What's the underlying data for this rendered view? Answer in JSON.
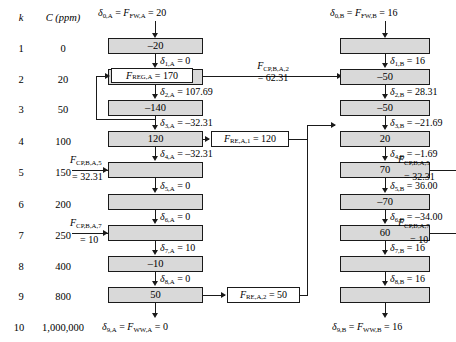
{
  "diagram": {
    "table": {
      "headers": {
        "k": "k",
        "c": "C (ppm)"
      },
      "rows": [
        {
          "k": "1",
          "c": "0"
        },
        {
          "k": "2",
          "c": "20"
        },
        {
          "k": "3",
          "c": "50"
        },
        {
          "k": "4",
          "c": "100"
        },
        {
          "k": "5",
          "c": "150"
        },
        {
          "k": "6",
          "c": "200"
        },
        {
          "k": "7",
          "c": "250"
        },
        {
          "k": "8",
          "c": "400"
        },
        {
          "k": "9",
          "c": "800"
        },
        {
          "k": "10",
          "c": "1,000,000"
        }
      ]
    },
    "columnA": {
      "inlet": "δ0,A = FFW,A = 20",
      "inlet_parts": {
        "delta": "δ",
        "sub1": "0,A",
        "eq1": "=",
        "f": "F",
        "sub2": "FW,A",
        "eq2": "=",
        "value": "20"
      },
      "boxes": [
        {
          "stage": "1",
          "value": "–20"
        },
        {
          "stage": "2",
          "value": ""
        },
        {
          "stage": "3",
          "value": "–140"
        },
        {
          "stage": "4",
          "value": "120"
        },
        {
          "stage": "5",
          "value": ""
        },
        {
          "stage": "6",
          "value": ""
        },
        {
          "stage": "7",
          "value": ""
        },
        {
          "stage": "8",
          "value": "–10"
        },
        {
          "stage": "9",
          "value": "50"
        }
      ],
      "deltas": [
        {
          "name": "δ1,A",
          "sub": "1,A",
          "value": "0"
        },
        {
          "name": "δ2,A",
          "sub": "2,A",
          "value": "107.69"
        },
        {
          "name": "δ3,A",
          "sub": "3,A",
          "value": "–32.31"
        },
        {
          "name": "δ4,A",
          "sub": "4,A",
          "value": "–32.31"
        },
        {
          "name": "δ5,A",
          "sub": "5,A",
          "value": "0"
        },
        {
          "name": "δ6,A",
          "sub": "6,A",
          "value": "0"
        },
        {
          "name": "δ7,A",
          "sub": "7,A",
          "value": "10"
        },
        {
          "name": "δ8,A",
          "sub": "8,A",
          "value": "0"
        }
      ],
      "outlet": {
        "sub1": "9,A",
        "sub2": "WW,A",
        "value": "0"
      }
    },
    "columnB": {
      "inlet_parts": {
        "sub1": "0,B",
        "sub2": "FW,B",
        "value": "16"
      },
      "boxes": [
        {
          "stage": "1",
          "value": ""
        },
        {
          "stage": "2",
          "value": "–50"
        },
        {
          "stage": "3",
          "value": "–50"
        },
        {
          "stage": "4",
          "value": "20"
        },
        {
          "stage": "5",
          "value": "70"
        },
        {
          "stage": "6",
          "value": "–70"
        },
        {
          "stage": "7",
          "value": "60"
        },
        {
          "stage": "8",
          "value": ""
        },
        {
          "stage": "9",
          "value": ""
        }
      ],
      "deltas": [
        {
          "sub": "1,B",
          "value": "16"
        },
        {
          "sub": "2,B",
          "value": "28.31"
        },
        {
          "sub": "3,B",
          "value": "–21.69"
        },
        {
          "sub": "4,B",
          "value": "–1.69"
        },
        {
          "sub": "5,B",
          "value": "36.00"
        },
        {
          "sub": "6,B",
          "value": "–34.00"
        },
        {
          "sub": "7,B",
          "value": "16"
        },
        {
          "sub": "8,B",
          "value": "16"
        }
      ],
      "outlet": {
        "sub1": "9,B",
        "sub2": "WW,B",
        "value": "16"
      }
    },
    "flow_labels": {
      "reg_a": {
        "sub": "REG,A",
        "value": "170"
      },
      "cp_ba2": {
        "sub": "CP,B,A,2",
        "value": "62.31"
      },
      "re_a1": {
        "sub": "RE,A,1",
        "value": "120"
      },
      "cp_ba5_left": {
        "sub": "CP,B,A,5",
        "value": "32.31"
      },
      "cp_ba5_right": {
        "sub": "CP,B,A,5",
        "value": "32.31"
      },
      "cp_ba7_left": {
        "sub": "CP,B,A,7",
        "value": "10"
      },
      "cp_ba7_right": {
        "sub": "CP,B,A,7",
        "value": "10"
      },
      "re_a2": {
        "sub": "RE,A,2",
        "value": "50"
      }
    },
    "colors": {
      "box_fill": "#d9d9d9",
      "stroke": "#1a1a1a",
      "background": "#ffffff"
    }
  }
}
